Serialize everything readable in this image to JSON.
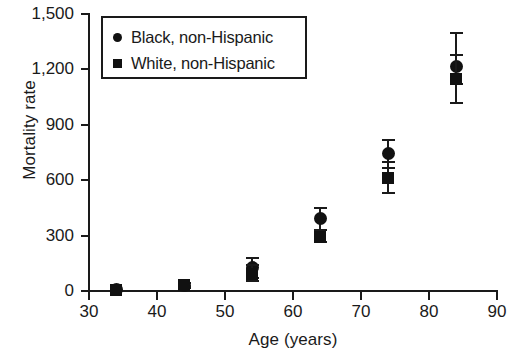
{
  "chart_data": {
    "type": "scatter",
    "title": "",
    "xlabel": "Age (years)",
    "ylabel": "Mortality rate",
    "xlim": [
      30,
      90
    ],
    "ylim": [
      0,
      1500
    ],
    "xticks": [
      30,
      40,
      50,
      60,
      70,
      80,
      90
    ],
    "yticks": [
      0,
      300,
      600,
      900,
      1200,
      1500
    ],
    "ytick_labels": [
      "0",
      "300",
      "600",
      "900",
      "1,200",
      "1,500"
    ],
    "grid": false,
    "legend_position": "top-left",
    "x": [
      34,
      44,
      54,
      64,
      74,
      84
    ],
    "series": [
      {
        "name": "Black, non-Hispanic",
        "marker": "circle",
        "values": [
          8,
          32,
          125,
          390,
          745,
          1215
        ],
        "err_low": [
          8,
          18,
          70,
          330,
          665,
          1120
        ],
        "err_high": [
          8,
          45,
          180,
          450,
          820,
          1395
        ]
      },
      {
        "name": "White, non-Hispanic",
        "marker": "square",
        "values": [
          8,
          30,
          92,
          295,
          612,
          1150
        ],
        "err_low": [
          8,
          20,
          55,
          265,
          530,
          1020
        ],
        "err_high": [
          8,
          42,
          140,
          330,
          700,
          1280
        ]
      }
    ]
  },
  "legend": {
    "items": [
      {
        "label": "Black, non-Hispanic",
        "marker": "circle"
      },
      {
        "label": "White, non-Hispanic",
        "marker": "square"
      }
    ]
  },
  "axes": {
    "x_title": "Age (years)",
    "y_title": "Mortality rate"
  },
  "colors": {
    "marker": "#111111",
    "axis": "#1a1a1a",
    "background": "#ffffff"
  }
}
